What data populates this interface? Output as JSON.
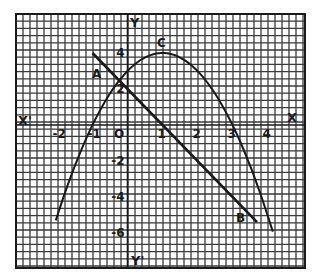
{
  "chart_data": {
    "type": "line",
    "title": "",
    "xlabel": "X",
    "xlabel_neg": "X'",
    "ylabel": "Y",
    "ylabel_neg": "Y'",
    "origin_label": "O",
    "xlim": [
      -2.5,
      5.0
    ],
    "ylim": [
      -8.0,
      6.0
    ],
    "grid": true,
    "x_ticks": [
      {
        "value": -2,
        "label": "-2"
      },
      {
        "value": -1,
        "label": "-1"
      },
      {
        "value": 1,
        "label": "1"
      },
      {
        "value": 2,
        "label": "2"
      },
      {
        "value": 3,
        "label": "3"
      },
      {
        "value": 4,
        "label": "4"
      }
    ],
    "y_ticks": [
      {
        "value": 4,
        "label": "4"
      },
      {
        "value": 2,
        "label": "2"
      },
      {
        "value": -2,
        "label": "-2"
      },
      {
        "value": -4,
        "label": "-4"
      },
      {
        "value": -6,
        "label": "-6"
      }
    ],
    "series": [
      {
        "name": "parabola",
        "equation": "y = 3 + 2x - x^2",
        "x_range": [
          -2.05,
          4.15
        ],
        "points": [
          [
            -2,
            -5
          ],
          [
            -1,
            0
          ],
          [
            0,
            3
          ],
          [
            1,
            4
          ],
          [
            2,
            3
          ],
          [
            3,
            0
          ],
          [
            4,
            -5
          ]
        ]
      },
      {
        "name": "line AB",
        "equation": "y = 2 - 2x",
        "x_range": [
          -1,
          3.7
        ],
        "points": [
          [
            -1,
            4
          ],
          [
            0,
            2
          ],
          [
            1,
            0
          ],
          [
            2,
            -2
          ],
          [
            3,
            -4
          ],
          [
            3.7,
            -5.4
          ]
        ]
      }
    ],
    "annotations": [
      {
        "label": "A",
        "x": -0.7,
        "y": 2.6,
        "note": "intersection of line and parabola"
      },
      {
        "label": "C",
        "x": 1,
        "y": 4,
        "note": "vertex of parabola"
      },
      {
        "label": "B",
        "x": 3.3,
        "y": -4.9,
        "note": "point on line"
      }
    ]
  },
  "labels": {
    "x_pos": "X",
    "x_neg": "X'",
    "y_pos": "Y",
    "y_neg": "Y'",
    "origin": "O",
    "A": "A",
    "B": "B",
    "C": "C"
  }
}
